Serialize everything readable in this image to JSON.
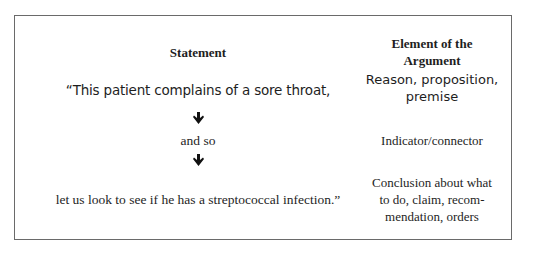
{
  "table": {
    "headers": {
      "statement": "Statement",
      "element": "Element of the Argument",
      "element_line1": "Element of the",
      "element_line2": "Argument"
    },
    "rows": [
      {
        "statement": "“This patient complains of a sore throat,",
        "element": "Reason, proposition, premise",
        "element_line1": "Reason, proposition,",
        "element_line2": "premise"
      },
      {
        "statement": "and so",
        "element": "Indicator/connector"
      },
      {
        "statement": "let us look to see if he has a streptococcal infection.”",
        "element": "Conclusion about what to do, claim, recommendation, orders",
        "element_line1": "Conclusion about what",
        "element_line2": "to do, claim, recom-",
        "element_line3": "mendation, orders"
      }
    ],
    "connectors": [
      {
        "icon": "down-arrow-icon"
      },
      {
        "icon": "down-arrow-icon"
      }
    ]
  }
}
